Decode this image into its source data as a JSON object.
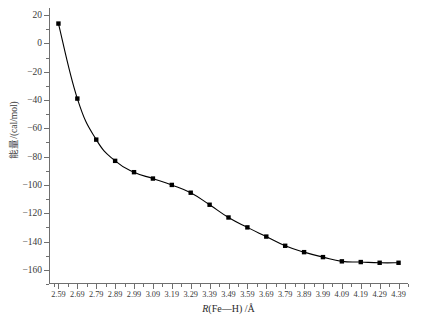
{
  "chart_data": {
    "type": "line",
    "title": "",
    "subtitle": "",
    "xlabel": "R(Fe—H) /Å",
    "xlabel_italic_part": "R",
    "xlabel_rest": "(Fe—H) /Å",
    "ylabel": "能量/(cal/mol)",
    "xlim": [
      2.54,
      4.44
    ],
    "ylim": [
      -170,
      25
    ],
    "grid": false,
    "legend": null,
    "marker": "filled-square",
    "line_color": "#000000",
    "marker_color": "#000000",
    "x_tick_labels": [
      "2.59",
      "2.69",
      "2.79",
      "2.89",
      "2.99",
      "3.09",
      "3.19",
      "3.29",
      "3.39",
      "3.49",
      "3.59",
      "3.69",
      "3.79",
      "3.89",
      "3.99",
      "4.09",
      "4.19",
      "4.29",
      "4.39"
    ],
    "y_tick_labels": [
      "20",
      "0",
      "−20",
      "−40",
      "−60",
      "−80",
      "−100",
      "−120",
      "−140",
      "−160"
    ],
    "y_ticks": [
      20,
      0,
      -20,
      -40,
      -60,
      -80,
      -100,
      -120,
      -140,
      -160
    ],
    "x": [
      2.59,
      2.69,
      2.79,
      2.89,
      2.99,
      3.09,
      3.19,
      3.29,
      3.39,
      3.49,
      3.59,
      3.69,
      3.79,
      3.89,
      3.99,
      4.09,
      4.19,
      4.29,
      4.39
    ],
    "values": [
      14,
      -39,
      -68,
      -83,
      -91,
      -95.5,
      -100,
      -105.5,
      -114,
      -123,
      -130,
      -136.5,
      -143,
      -147.5,
      -151,
      -154,
      -154.5,
      -155,
      -155
    ],
    "series": [
      {
        "name": "energy",
        "values": [
          14,
          -39,
          -68,
          -83,
          -91,
          -95.5,
          -100,
          -105.5,
          -114,
          -123,
          -130,
          -136.5,
          -143,
          -147.5,
          -151,
          -154,
          -154.5,
          -155,
          -155
        ]
      }
    ]
  }
}
